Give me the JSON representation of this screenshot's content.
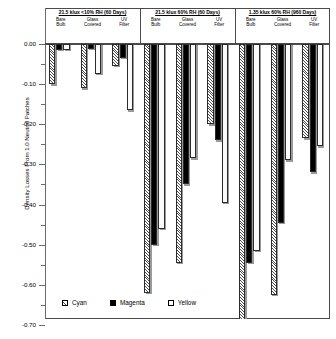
{
  "chart_data": {
    "type": "bar",
    "title": "",
    "xlabel": "",
    "ylabel": "Density Losses From 1.0 Neutral Patches",
    "ylim": [
      -0.7,
      0.0
    ],
    "yticks": [
      0.0,
      -0.1,
      -0.2,
      -0.3,
      -0.4,
      -0.5,
      -0.6,
      -0.7
    ],
    "ytick_labels": [
      "0.00",
      "-0.10",
      "-0.20",
      "-0.30",
      "-0.40",
      "-0.50",
      "-0.60",
      "-0.70"
    ],
    "grid": false,
    "legend_position": "bottom-left",
    "series": [
      {
        "name": "Cyan",
        "fill": "hatched",
        "values": [
          -0.1,
          -0.11,
          -0.055,
          -0.62,
          -0.545,
          -0.2,
          -0.69,
          -0.625,
          -0.235
        ]
      },
      {
        "name": "Magenta",
        "fill": "solid-black",
        "values": [
          -0.015,
          -0.012,
          -0.035,
          -0.5,
          -0.35,
          -0.24,
          -0.545,
          -0.445,
          -0.32
        ]
      },
      {
        "name": "Yellow",
        "fill": "white",
        "values": [
          -0.015,
          -0.075,
          -0.165,
          -0.46,
          -0.285,
          -0.395,
          -0.515,
          -0.29,
          -0.255
        ]
      }
    ],
    "categories": [
      "Bare Bulb",
      "Glass Covered",
      "UV Filter",
      "Bare Bulb",
      "Glass Covered",
      "UV Filter",
      "Bare Bulb",
      "Glass Covered",
      "UV Filter"
    ],
    "groups": [
      {
        "title": "21.5 klux <10% RH (60 Days)",
        "conditions": [
          {
            "label_line1": "Bare",
            "label_line2": "Bulb",
            "cyan": -0.1,
            "magenta": -0.015,
            "yellow": -0.015
          },
          {
            "label_line1": "Glass",
            "label_line2": "Covered",
            "cyan": -0.11,
            "magenta": -0.012,
            "yellow": -0.075
          },
          {
            "label_line1": "UV",
            "label_line2": "Filter",
            "cyan": -0.055,
            "magenta": -0.035,
            "yellow": -0.165
          }
        ]
      },
      {
        "title": "21.5 klux 60% RH (60 Days)",
        "conditions": [
          {
            "label_line1": "Bare",
            "label_line2": "Bulb",
            "cyan": -0.62,
            "magenta": -0.5,
            "yellow": -0.46
          },
          {
            "label_line1": "Glass",
            "label_line2": "Covered",
            "cyan": -0.545,
            "magenta": -0.35,
            "yellow": -0.285
          },
          {
            "label_line1": "UV",
            "label_line2": "Filter",
            "cyan": -0.2,
            "magenta": -0.24,
            "yellow": -0.395
          }
        ]
      },
      {
        "title": "1.35 klux 60% RH (960 Days)",
        "conditions": [
          {
            "label_line1": "Bare",
            "label_line2": "Bulb",
            "cyan": -0.69,
            "magenta": -0.545,
            "yellow": -0.515
          },
          {
            "label_line1": "Glass",
            "label_line2": "Covered",
            "cyan": -0.625,
            "magenta": -0.445,
            "yellow": -0.29
          },
          {
            "label_line1": "UV",
            "label_line2": "Filter",
            "cyan": -0.235,
            "magenta": -0.32,
            "yellow": -0.255
          }
        ]
      }
    ],
    "colors": {
      "cyan_hatch": "#4d4d4d",
      "magenta_solid": "#000000",
      "yellow_fill": "#fbfbfb",
      "axis": "#4a4a4a",
      "bar_outline": "#2b2b2b",
      "bar_shadow": "#9a9a9a"
    }
  },
  "legend": {
    "items": [
      {
        "label": "Cyan"
      },
      {
        "label": "Magenta"
      },
      {
        "label": "Yellow"
      }
    ]
  },
  "axis": {
    "y_title": "Density Losses From 1.0 Neutral Patches"
  }
}
